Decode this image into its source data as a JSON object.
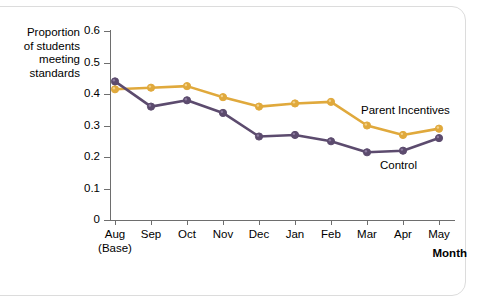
{
  "chart_data": {
    "type": "line",
    "title": "",
    "xlabel": "Month",
    "ylabel": "Proportion\nof students\nmeeting\nstandards",
    "categories": [
      "Aug",
      "Sep",
      "Oct",
      "Nov",
      "Dec",
      "Jan",
      "Feb",
      "Mar",
      "Apr",
      "May"
    ],
    "category_sublabels": [
      "(Base)",
      "",
      "",
      "",
      "",
      "",
      "",
      "",
      "",
      ""
    ],
    "ytick_labels": [
      "0.6",
      "0.5",
      "0.4",
      "0.3",
      "0.2",
      "0.1",
      "0"
    ],
    "ytick_values": [
      0.6,
      0.5,
      0.4,
      0.3,
      0.2,
      0.1,
      0
    ],
    "ylim": [
      0,
      0.6
    ],
    "grid": false,
    "legend_position": "inline-annotation",
    "series": [
      {
        "name": "Parent Incentives",
        "color": "#E0A93C",
        "values": [
          0.415,
          0.42,
          0.425,
          0.39,
          0.36,
          0.37,
          0.375,
          0.3,
          0.27,
          0.29
        ]
      },
      {
        "name": "Control",
        "color": "#5C4B6E",
        "values": [
          0.44,
          0.36,
          0.38,
          0.34,
          0.265,
          0.27,
          0.25,
          0.215,
          0.22,
          0.26
        ]
      }
    ],
    "annotations": [
      {
        "text": "Parent Incentives",
        "series": "Parent Incentives"
      },
      {
        "text": "Control",
        "series": "Control"
      }
    ]
  },
  "colors": {
    "parent_incentives": "#E0A93C",
    "control": "#5C4B6E",
    "axis": "#6e6e6e",
    "frame_border": "#dcdcdc",
    "background": "#ffffff"
  }
}
